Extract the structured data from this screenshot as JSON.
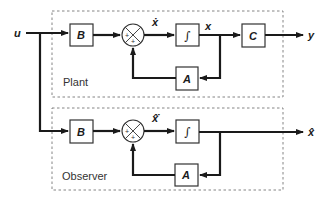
{
  "diagram": {
    "type": "block-diagram",
    "input": {
      "label": "u"
    },
    "plant": {
      "group_label": "Plant",
      "blocks": {
        "input_matrix": "B",
        "integrator": "∫",
        "state_matrix": "A",
        "output_matrix": "C"
      },
      "signals": {
        "state_derivative": "ẋ",
        "state": "x",
        "output": "y"
      },
      "summing_junction": {
        "signs": [
          "+",
          "+"
        ]
      }
    },
    "observer": {
      "group_label": "Observer",
      "blocks": {
        "input_matrix": "B",
        "integrator": "∫",
        "state_matrix": "A"
      },
      "signals": {
        "state_derivative": "x̂̇",
        "state_estimate": "x̂"
      },
      "summing_junction": {
        "signs": [
          "+",
          "+"
        ]
      }
    },
    "colors": {
      "line": "#1a1a1a",
      "block_border": "#333333",
      "dashed_border": "#777777",
      "background": "#ffffff"
    }
  }
}
